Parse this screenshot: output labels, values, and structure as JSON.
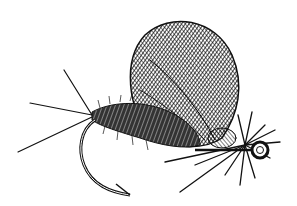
{
  "image": {
    "subject": "Fishing fly illustration",
    "style": "black ink crosshatch drawing on white",
    "colors": {
      "ink": "#111111",
      "paper": "#ffffff"
    },
    "parts": [
      "wing",
      "tail-fibers",
      "dubbed-body",
      "hook",
      "hackle",
      "hook-eye"
    ]
  }
}
